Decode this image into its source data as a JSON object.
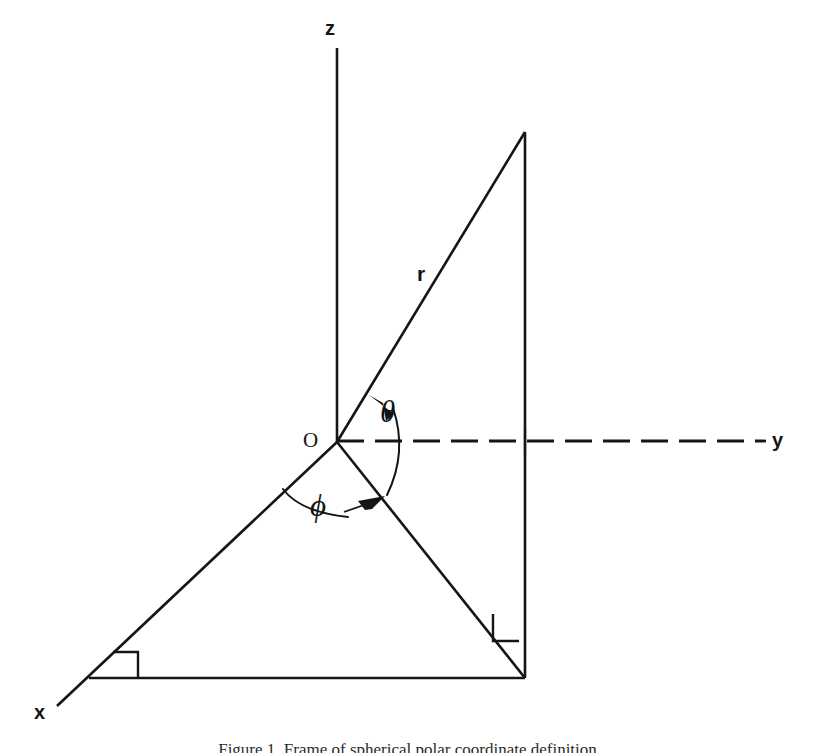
{
  "figure": {
    "caption": "Figure 1. Frame of spherical polar coordinate definition",
    "background_color": "#ffffff",
    "ink_color": "#151515"
  },
  "axes": {
    "z": {
      "label": "z",
      "label_x": 325,
      "label_y": 18,
      "from": [
        337,
        48
      ],
      "to": [
        337,
        442
      ],
      "style": "solid"
    },
    "y": {
      "label": "y",
      "label_x": 772,
      "label_y": 430,
      "from": [
        337,
        441
      ],
      "to": [
        766,
        441
      ],
      "style": "dashed"
    },
    "x": {
      "label": "x",
      "label_x": 34,
      "label_y": 702,
      "from": [
        337,
        442
      ],
      "to": [
        57,
        706
      ],
      "style": "solid"
    }
  },
  "points": {
    "origin": {
      "label": "O",
      "label_x": 303,
      "label_y": 430,
      "x": 337,
      "y": 442
    },
    "apex": {
      "x": 525,
      "y": 132
    },
    "foot_of_vertical": {
      "x": 525,
      "y": 678
    },
    "x_axis_corner": {
      "x": 89,
      "y": 678
    },
    "y_axis_crossing": {
      "x": 525,
      "y": 441
    }
  },
  "segments": {
    "radius": {
      "label": "r",
      "label_x": 417,
      "label_y": 263,
      "from": [
        337,
        442
      ],
      "to": [
        525,
        132
      ]
    },
    "vertical_drop": {
      "from": [
        525,
        132
      ],
      "to": [
        525,
        678
      ]
    },
    "projection": {
      "from": [
        337,
        442
      ],
      "to": [
        525,
        678
      ]
    },
    "base": {
      "from": [
        89,
        678
      ],
      "to": [
        525,
        678
      ]
    }
  },
  "angles": {
    "theta": {
      "label": "θ",
      "label_x": 380,
      "label_y": 396,
      "description": "polar angle from z-axis measured at origin, arc with arrowhead toward r"
    },
    "phi": {
      "label": "ϕ",
      "label_x": 310,
      "label_y": 490,
      "description": "azimuthal angle from x-axis to projection of r, arc with arrowhead"
    }
  },
  "markers": {
    "right_angle_bottom_left": {
      "x": 89,
      "y": 678,
      "note": "right angle between x-axis and base line"
    },
    "right_angle_bottom_right": {
      "x": 525,
      "y": 678,
      "note": "right angle between base line and vertical drop"
    }
  }
}
